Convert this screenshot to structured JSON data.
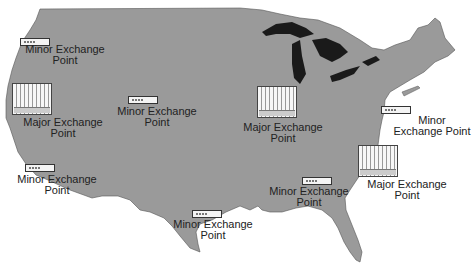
{
  "map": {
    "title": "US Internet Exchange Points",
    "land_color": "#9a9a9a",
    "lakes_color": "#1a1a1a",
    "background": "#ffffff"
  },
  "exchange_points": [
    {
      "id": "pacific-northwest",
      "type": "minor",
      "label_line1": "Minor Exchange",
      "label_line2": "Point"
    },
    {
      "id": "california-north",
      "type": "major",
      "label_line1": "Major Exchange",
      "label_line2": "Point"
    },
    {
      "id": "mountain-west",
      "type": "minor",
      "label_line1": "Minor Exchange",
      "label_line2": "Point"
    },
    {
      "id": "midwest",
      "type": "major",
      "label_line1": "Major Exchange",
      "label_line2": "Point"
    },
    {
      "id": "northeast",
      "type": "minor",
      "label_line1": "Minor",
      "label_line2": "Exchange Point"
    },
    {
      "id": "southern-california",
      "type": "minor",
      "label_line1": "Minor Exchange",
      "label_line2": "Point"
    },
    {
      "id": "southeast",
      "type": "minor",
      "label_line1": "Minor Exchange",
      "label_line2": "Point"
    },
    {
      "id": "mid-atlantic",
      "type": "major",
      "label_line1": "Major Exchange",
      "label_line2": "Point"
    },
    {
      "id": "texas",
      "type": "minor",
      "label_line1": "Minor Exchange",
      "label_line2": "Point"
    }
  ]
}
